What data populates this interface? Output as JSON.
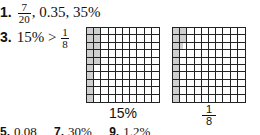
{
  "answers": [
    {
      "number": "1.",
      "fraction": {
        "numerator": "7",
        "denominator": "20"
      },
      "rest": ", 0.35, 35%"
    },
    {
      "number": "3.",
      "lhs": "15%",
      "operator": ">",
      "fraction": {
        "numerator": "1",
        "denominator": "8"
      }
    }
  ],
  "grids": [
    {
      "caption": "15%",
      "rows": 10,
      "cols": 10,
      "shaded_description": "first column fully shaded (10 cells), top 5 cells of second column shaded",
      "shaded_count": 15
    },
    {
      "caption_fraction": {
        "numerator": "1",
        "denominator": "8"
      },
      "rows": 10,
      "cols": 10,
      "shaded_description": "first column fully shaded (10 cells), top 2 cells of second column shaded plus half of third cell",
      "shaded_count": 12.5
    }
  ],
  "bottom_row": [
    {
      "number": "5.",
      "value": "0.08"
    },
    {
      "number": "7.",
      "value": "30%"
    },
    {
      "number": "9.",
      "value": "1.2%"
    }
  ],
  "colors": {
    "shade": "#cfcfcf",
    "grid_line": "#222222",
    "text": "#111111"
  }
}
